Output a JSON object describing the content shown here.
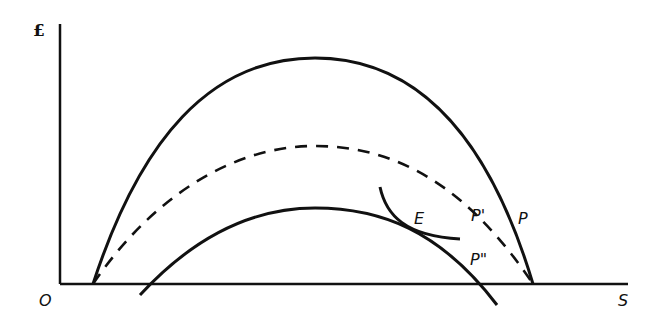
{
  "diagram": {
    "axes": {
      "y_label": "£",
      "x_label": "S",
      "origin_label": "O"
    },
    "curves": [
      {
        "id": "P",
        "label": "P",
        "style": "solid",
        "description": "outer hump curve"
      },
      {
        "id": "P-prime",
        "label": "P'",
        "style": "dashed",
        "description": "middle dashed hump curve"
      },
      {
        "id": "P-double-prime",
        "label": "P\"",
        "style": "solid",
        "description": "lower hump curve extending below axis"
      },
      {
        "id": "indifference",
        "label": "E",
        "style": "solid",
        "description": "curve tangent to P\" at E"
      }
    ],
    "point_label": "E",
    "colors": {
      "ink": "#111111",
      "background": "#ffffff"
    }
  }
}
